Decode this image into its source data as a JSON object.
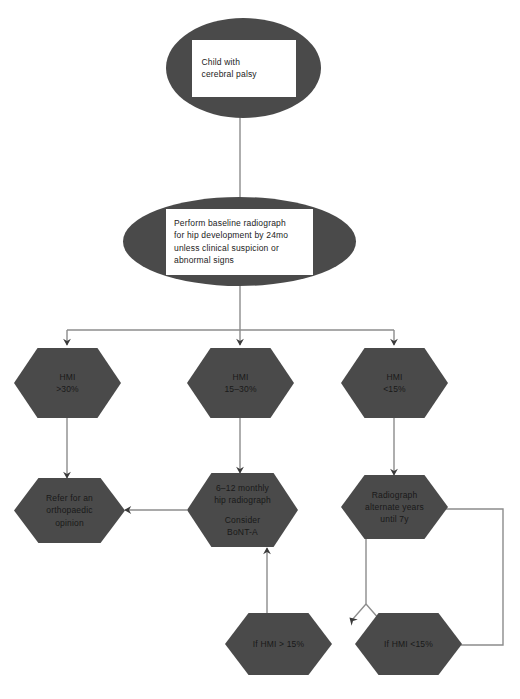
{
  "diagram": {
    "background_color": "#ffffff",
    "node_fill_color": "#4a4a4a",
    "node_text_color": "#1b1b1b",
    "edge_color": "#808080",
    "arrowhead_color": "#3a3a3a",
    "inner_box_color": "#ffffff"
  },
  "nodes": {
    "start": {
      "shape": "ellipse",
      "line1": "Child with",
      "line2": "cerebral palsy"
    },
    "baseline": {
      "shape": "ellipse",
      "line1": "Perform baseline radiograph",
      "line2": "for hip development by 24mo",
      "line3": "unless clinical suspicion or",
      "line4": "abnormal signs"
    },
    "hmi_high": {
      "shape": "hexagon",
      "line1": "HMI",
      "line2": ">30%"
    },
    "hmi_mid": {
      "shape": "hexagon",
      "line1": "HMI",
      "line2": "15–30%"
    },
    "hmi_low": {
      "shape": "hexagon",
      "line1": "HMI",
      "line2": "<15%"
    },
    "refer": {
      "shape": "hexagon",
      "line1": "Refer for an",
      "line2": "orthopaedic",
      "line3": "opinion"
    },
    "monitor_6_12": {
      "shape": "hexagon",
      "line1": "6–12 monthly",
      "line2": "hip radiograph",
      "line3": "Consider",
      "line4": "BoNT-A"
    },
    "alternate_years": {
      "shape": "hexagon",
      "line1": "Radiograph",
      "line2": "alternate years",
      "line3": "until 7y"
    },
    "if_hmi_high": {
      "shape": "hexagon",
      "line1": "If HMI > 15%"
    },
    "if_hmi_low": {
      "shape": "hexagon",
      "line1": "If HMI <15%"
    }
  },
  "edges": [
    {
      "from": "start",
      "to": "baseline",
      "style": "straight-down"
    },
    {
      "from": "baseline",
      "to": "hmi_high",
      "style": "branch-left"
    },
    {
      "from": "baseline",
      "to": "hmi_mid",
      "style": "branch-center"
    },
    {
      "from": "baseline",
      "to": "hmi_low",
      "style": "branch-right"
    },
    {
      "from": "hmi_high",
      "to": "refer",
      "style": "straight-down"
    },
    {
      "from": "hmi_mid",
      "to": "monitor_6_12",
      "style": "straight-down"
    },
    {
      "from": "hmi_low",
      "to": "alternate_years",
      "style": "straight-down"
    },
    {
      "from": "monitor_6_12",
      "to": "refer",
      "style": "straight-left"
    },
    {
      "from": "if_hmi_high",
      "to": "monitor_6_12",
      "style": "straight-up"
    },
    {
      "from": "alternate_years",
      "to": "if_hmi_high",
      "style": "split-down-left"
    },
    {
      "from": "alternate_years",
      "to": "if_hmi_low",
      "style": "split-down-right"
    },
    {
      "from": "if_hmi_low",
      "to": "alternate_years",
      "style": "loop-back-right"
    }
  ]
}
